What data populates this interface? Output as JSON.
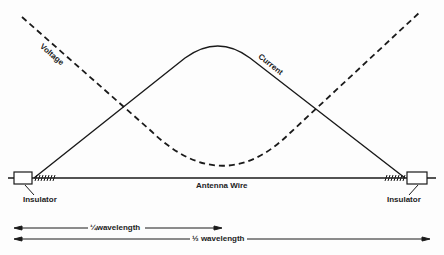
{
  "diagram": {
    "curves": {
      "voltage_label": "Voltage",
      "current_label": "Current"
    },
    "wire_label": "Antenna Wire",
    "insulator_left_label": "Insulator",
    "insulator_right_label": "Insulator",
    "quarter_wavelength_label": "¼wavelength",
    "half_wavelength_label": "½ wavelength",
    "colors": {
      "line": "#1a1a1a",
      "background": "#fdfdfd"
    }
  }
}
